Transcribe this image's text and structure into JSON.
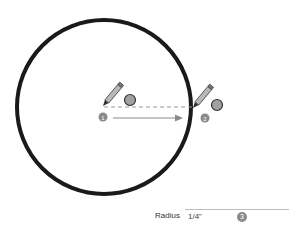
{
  "diagram": {
    "type": "circle-tool-instructions",
    "circle": {
      "cx": 104,
      "cy": 107,
      "r": 87,
      "stroke": "#1a1a1a",
      "stroke_width": 4
    },
    "steps": [
      {
        "number": "1",
        "label": "Click to set center",
        "x": 103,
        "y": 117
      },
      {
        "number": "2",
        "label": "Click to set radius",
        "x": 205,
        "y": 118
      },
      {
        "number": "3",
        "label": "Type radius value",
        "x": 212,
        "y": 216
      }
    ],
    "colors": {
      "badge": "#8a8a8a",
      "marker_fill": "#a0a0a0",
      "dashed_line": "#9a9a9a",
      "arrow": "#8a8a8a"
    }
  },
  "measurements": {
    "label": "Radius",
    "value": "1/4\"",
    "step_badge": "3"
  }
}
